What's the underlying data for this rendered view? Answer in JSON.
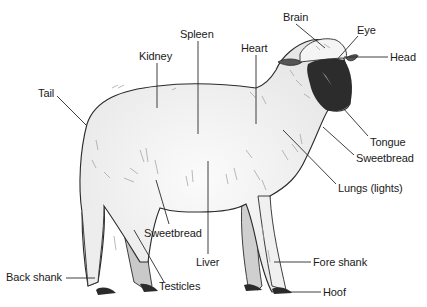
{
  "diagram": {
    "colors": {
      "background": "#ffffff",
      "body_fill": "#ececec",
      "body_highlight": "#fafafa",
      "far_leg_fill": "#c9c9c9",
      "face_fill": "#2c2c2c",
      "hoof_fill": "#2a2a2a",
      "outline": "#2a2a2a",
      "leader_line": "#2a2a2a",
      "label_text": "#1a1a1a"
    },
    "labels": [
      {
        "id": "brain",
        "text": "Brain",
        "x": 283,
        "y": 11,
        "line": [
          [
            296,
            24
          ],
          [
            325,
            48
          ]
        ]
      },
      {
        "id": "eye",
        "text": "Eye",
        "x": 357,
        "y": 24,
        "line": [
          [
            358,
            36
          ],
          [
            326,
            72
          ]
        ]
      },
      {
        "id": "head",
        "text": "Head",
        "x": 390,
        "y": 51,
        "line": [
          [
            388,
            57
          ],
          [
            344,
            57
          ]
        ]
      },
      {
        "id": "spleen",
        "text": "Spleen",
        "x": 180,
        "y": 28,
        "line": [
          [
            198,
            41
          ],
          [
            198,
            134
          ]
        ]
      },
      {
        "id": "heart",
        "text": "Heart",
        "x": 241,
        "y": 42,
        "line": [
          [
            256,
            55
          ],
          [
            256,
            124
          ]
        ]
      },
      {
        "id": "kidney",
        "text": "Kidney",
        "x": 139,
        "y": 50,
        "line": [
          [
            157,
            63
          ],
          [
            157,
            108
          ]
        ]
      },
      {
        "id": "tail",
        "text": "Tail",
        "x": 38,
        "y": 87,
        "line": [
          [
            57,
            96
          ],
          [
            87,
            126
          ]
        ]
      },
      {
        "id": "tongue",
        "text": "Tongue",
        "x": 370,
        "y": 136,
        "line": [
          [
            368,
            136
          ],
          [
            343,
            108
          ]
        ]
      },
      {
        "id": "sweetbread_front",
        "text": "Sweetbread",
        "x": 356,
        "y": 152,
        "line": [
          [
            354,
            155
          ],
          [
            323,
            127
          ]
        ]
      },
      {
        "id": "lungs",
        "text": "Lungs (lights)",
        "x": 338,
        "y": 182,
        "line": [
          [
            336,
            184
          ],
          [
            283,
            130
          ]
        ]
      },
      {
        "id": "sweetbread_rear",
        "text": "Sweetbread",
        "x": 144,
        "y": 227,
        "line": [
          [
            169,
            224
          ],
          [
            156,
            180
          ]
        ]
      },
      {
        "id": "liver",
        "text": "Liver",
        "x": 196,
        "y": 256,
        "line": [
          [
            208,
            254
          ],
          [
            208,
            161
          ]
        ]
      },
      {
        "id": "fore_shank",
        "text": "Fore shank",
        "x": 313,
        "y": 256,
        "line": [
          [
            311,
            262
          ],
          [
            274,
            262
          ]
        ]
      },
      {
        "id": "back_shank",
        "text": "Back shank",
        "x": 6,
        "y": 271,
        "line": [
          [
            66,
            278
          ],
          [
            95,
            278
          ]
        ]
      },
      {
        "id": "testicles",
        "text": "Testicles",
        "x": 159,
        "y": 280,
        "line": [
          [
            164,
            282
          ],
          [
            134,
            230
          ]
        ]
      },
      {
        "id": "hoof",
        "text": "Hoof",
        "x": 323,
        "y": 286,
        "line": [
          [
            321,
            292
          ],
          [
            285,
            292
          ]
        ]
      }
    ]
  }
}
